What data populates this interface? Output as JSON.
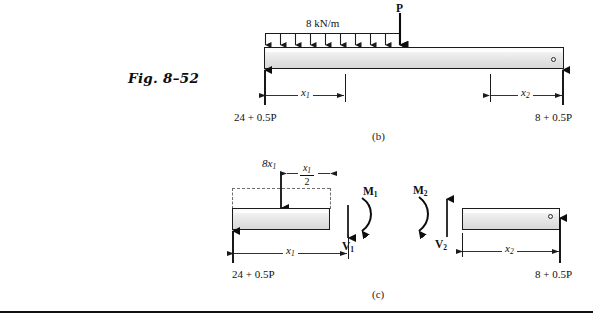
{
  "figure": {
    "label": "Fig. 8–52"
  },
  "diagram_b": {
    "caption": "(b)",
    "distributed_load_label": "8 kN/m",
    "point_load_label": "P",
    "left_reaction_label": "24 + 0.5P",
    "right_reaction_label": "8 + 0.5P",
    "dim_x1": "x",
    "dim_x1_sub": "1",
    "dim_x2": "x",
    "dim_x2_sub": "2",
    "distributed_arrow_count": 10
  },
  "diagram_c": {
    "caption": "(c)",
    "left": {
      "resultant_load": "8x",
      "resultant_load_sub": "1",
      "half_dim_numerator": "x",
      "half_dim_numerator_sub": "1",
      "half_dim_denominator": "2",
      "moment_label": "M",
      "moment_sub": "1",
      "shear_label": "V",
      "shear_sub": "1",
      "reaction_label": "24 + 0.5P",
      "dim_label": "x",
      "dim_label_sub": "1"
    },
    "right": {
      "moment_label": "M",
      "moment_sub": "2",
      "shear_label": "V",
      "shear_sub": "2",
      "reaction_label": "8 + 0.5P",
      "dim_label": "x",
      "dim_label_sub": "2"
    }
  },
  "colors": {
    "ink": "#1b1b1b",
    "beam_fill_top": "#fbfbfb",
    "beam_fill_bottom": "#d8d8d8",
    "dashed": "#6f6f6f",
    "rule": "#111111"
  }
}
